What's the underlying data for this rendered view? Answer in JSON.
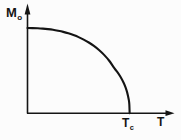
{
  "chart_data": {
    "type": "line",
    "title": "",
    "subtitle": "",
    "xlabel": "T",
    "ylabel": "M",
    "ylabel_sub": "o",
    "xlabel_sub": "",
    "annotations": [
      {
        "name": "critical-temperature",
        "text": "T",
        "sub": "c",
        "x_value": 1.0,
        "y_value": 0.0
      }
    ],
    "legend": [],
    "legend_position": "none",
    "grid": false,
    "axis_arrows": true,
    "xlim": [
      0,
      1.4
    ],
    "ylim": [
      0,
      1.18
    ],
    "xticks": [],
    "yticks": [],
    "xtick_labels": [],
    "ytick_labels": [],
    "series": [
      {
        "name": "spontaneous-magnetization",
        "color": "#141414",
        "x": [
          0.0,
          0.05,
          0.1,
          0.15,
          0.2,
          0.25,
          0.3,
          0.35,
          0.4,
          0.45,
          0.5,
          0.55,
          0.6,
          0.65,
          0.7,
          0.75,
          0.8,
          0.85,
          0.88,
          0.91,
          0.94,
          0.96,
          0.975,
          0.985,
          0.993,
          0.997,
          1.0
        ],
        "y": [
          1.0,
          0.999,
          0.997,
          0.993,
          0.987,
          0.979,
          0.968,
          0.955,
          0.938,
          0.917,
          0.893,
          0.864,
          0.83,
          0.79,
          0.742,
          0.685,
          0.616,
          0.528,
          0.482,
          0.428,
          0.36,
          0.303,
          0.247,
          0.197,
          0.148,
          0.1,
          0.0
        ]
      }
    ]
  },
  "labels": {
    "y_axis_main": "M",
    "y_axis_sub": "o",
    "x_axis_main": "T",
    "critical_main": "T",
    "critical_sub": "c"
  },
  "colors": {
    "curve": "#141414",
    "axis": "#151515",
    "background": "#fcfcfc"
  }
}
